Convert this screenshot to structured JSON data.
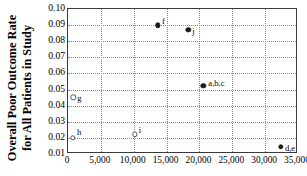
{
  "chart_data": {
    "type": "scatter",
    "title": "",
    "xlabel": "",
    "ylabel": "Overall Poor Outcome Rate for All Patients in Study",
    "ylabel_line1": "Overall Poor Outcome Rate",
    "ylabel_line2": "for All Patients in Study",
    "xlim": [
      0,
      35000
    ],
    "ylim": [
      0.01,
      0.1
    ],
    "grid": true,
    "legend": "none",
    "xticks": [
      0,
      5000,
      10000,
      15000,
      20000,
      25000,
      30000,
      35000
    ],
    "xticklabels": [
      "0",
      "5,000",
      "10,000",
      "15,000",
      "20,000",
      "25,000",
      "30,000",
      "35,000"
    ],
    "yticks": [
      0.01,
      0.02,
      0.03,
      0.04,
      0.05,
      0.06,
      0.07,
      0.08,
      0.09,
      0.1
    ],
    "yticklabels": [
      "0.01",
      "0.02",
      "0.03",
      "0.04",
      "0.05",
      "0.06",
      "0.07",
      "0.08",
      "0.09",
      "0.10"
    ],
    "points": [
      {
        "label": "f",
        "x": 13700,
        "y": 0.09,
        "marker": "filled",
        "label_dx": 4,
        "label_dy": -8
      },
      {
        "label": "j",
        "x": 18300,
        "y": 0.0872,
        "marker": "filled",
        "label_dx": 4,
        "label_dy": -3
      },
      {
        "label": "a,b,c",
        "x": 20600,
        "y": 0.0522,
        "marker": "filled",
        "label_dx": 5,
        "label_dy": -7
      },
      {
        "label": "g",
        "x": 800,
        "y": 0.0452,
        "marker": "open",
        "label_dx": 4,
        "label_dy": -3
      },
      {
        "label": "h",
        "x": 750,
        "y": 0.02,
        "marker": "open",
        "label_dx": 4,
        "label_dy": -10
      },
      {
        "label": "i",
        "x": 10150,
        "y": 0.0222,
        "marker": "open",
        "label_dx": 4,
        "label_dy": -8
      },
      {
        "label": "d,e",
        "x": 32400,
        "y": 0.0144,
        "marker": "filled",
        "label_dx": 4,
        "label_dy": -3
      }
    ]
  }
}
